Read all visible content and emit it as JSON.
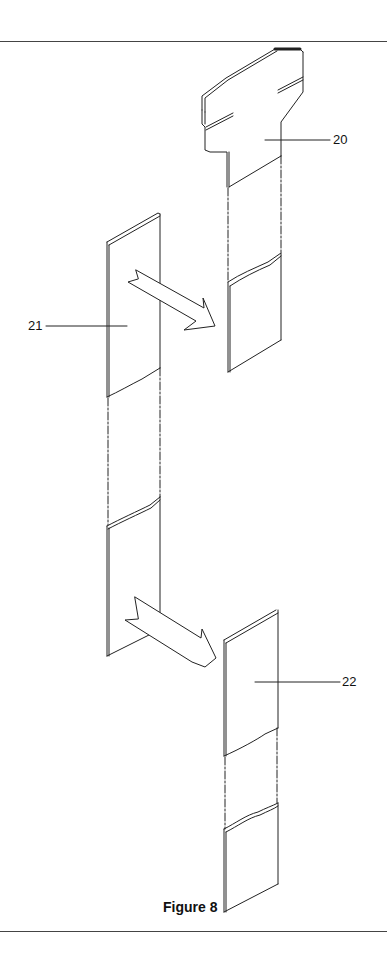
{
  "figure": {
    "caption": "Figure 8",
    "references": [
      {
        "id": "20",
        "label": "20"
      },
      {
        "id": "21",
        "label": "21"
      },
      {
        "id": "22",
        "label": "22"
      }
    ]
  },
  "colors": {
    "line": "#222222",
    "background": "#ffffff"
  }
}
